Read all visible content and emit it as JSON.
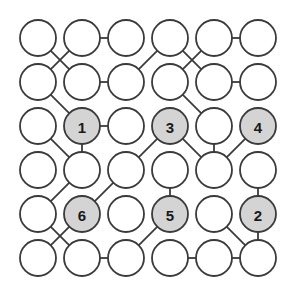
{
  "diagram": {
    "type": "node-link-graph",
    "colors": {
      "background": "#ffffff",
      "node_fill_empty": "#ffffff",
      "node_fill_labeled": "#d4d4d4",
      "node_stroke": "#3a3a3a",
      "edge_stroke": "#3a3a3a",
      "label_text": "#1a1a1a"
    },
    "geometry": {
      "width": 299,
      "height": 307,
      "columns": 6,
      "rows": 6,
      "col_x": [
        38,
        82,
        126,
        170,
        214,
        258
      ],
      "row_y": [
        38,
        82,
        126,
        170,
        214,
        258
      ],
      "node_radius": 18
    },
    "nodes": [
      {
        "id": "n0-0",
        "col": 0,
        "row": 0,
        "label": "",
        "filled": false
      },
      {
        "id": "n1-0",
        "col": 1,
        "row": 0,
        "label": "",
        "filled": false
      },
      {
        "id": "n2-0",
        "col": 2,
        "row": 0,
        "label": "",
        "filled": false
      },
      {
        "id": "n3-0",
        "col": 3,
        "row": 0,
        "label": "",
        "filled": false
      },
      {
        "id": "n4-0",
        "col": 4,
        "row": 0,
        "label": "",
        "filled": false
      },
      {
        "id": "n5-0",
        "col": 5,
        "row": 0,
        "label": "",
        "filled": false
      },
      {
        "id": "n0-1",
        "col": 0,
        "row": 1,
        "label": "",
        "filled": false
      },
      {
        "id": "n1-1",
        "col": 1,
        "row": 1,
        "label": "",
        "filled": false
      },
      {
        "id": "n2-1",
        "col": 2,
        "row": 1,
        "label": "",
        "filled": false
      },
      {
        "id": "n3-1",
        "col": 3,
        "row": 1,
        "label": "",
        "filled": false
      },
      {
        "id": "n4-1",
        "col": 4,
        "row": 1,
        "label": "",
        "filled": false
      },
      {
        "id": "n5-1",
        "col": 5,
        "row": 1,
        "label": "",
        "filled": false
      },
      {
        "id": "n0-2",
        "col": 0,
        "row": 2,
        "label": "",
        "filled": false
      },
      {
        "id": "n1-2",
        "col": 1,
        "row": 2,
        "label": "1",
        "filled": true
      },
      {
        "id": "n2-2",
        "col": 2,
        "row": 2,
        "label": "",
        "filled": false
      },
      {
        "id": "n3-2",
        "col": 3,
        "row": 2,
        "label": "3",
        "filled": true
      },
      {
        "id": "n4-2",
        "col": 4,
        "row": 2,
        "label": "",
        "filled": false
      },
      {
        "id": "n5-2",
        "col": 5,
        "row": 2,
        "label": "4",
        "filled": true
      },
      {
        "id": "n0-3",
        "col": 0,
        "row": 3,
        "label": "",
        "filled": false
      },
      {
        "id": "n1-3",
        "col": 1,
        "row": 3,
        "label": "",
        "filled": false
      },
      {
        "id": "n2-3",
        "col": 2,
        "row": 3,
        "label": "",
        "filled": false
      },
      {
        "id": "n3-3",
        "col": 3,
        "row": 3,
        "label": "",
        "filled": false
      },
      {
        "id": "n4-3",
        "col": 4,
        "row": 3,
        "label": "",
        "filled": false
      },
      {
        "id": "n5-3",
        "col": 5,
        "row": 3,
        "label": "",
        "filled": false
      },
      {
        "id": "n0-4",
        "col": 0,
        "row": 4,
        "label": "",
        "filled": false
      },
      {
        "id": "n1-4",
        "col": 1,
        "row": 4,
        "label": "6",
        "filled": true
      },
      {
        "id": "n2-4",
        "col": 2,
        "row": 4,
        "label": "",
        "filled": false
      },
      {
        "id": "n3-4",
        "col": 3,
        "row": 4,
        "label": "5",
        "filled": true
      },
      {
        "id": "n4-4",
        "col": 4,
        "row": 4,
        "label": "",
        "filled": false
      },
      {
        "id": "n5-4",
        "col": 5,
        "row": 4,
        "label": "2",
        "filled": true
      },
      {
        "id": "n0-5",
        "col": 0,
        "row": 5,
        "label": "",
        "filled": false
      },
      {
        "id": "n1-5",
        "col": 1,
        "row": 5,
        "label": "",
        "filled": false
      },
      {
        "id": "n2-5",
        "col": 2,
        "row": 5,
        "label": "",
        "filled": false
      },
      {
        "id": "n3-5",
        "col": 3,
        "row": 5,
        "label": "",
        "filled": false
      },
      {
        "id": "n4-5",
        "col": 4,
        "row": 5,
        "label": "",
        "filled": false
      },
      {
        "id": "n5-5",
        "col": 5,
        "row": 5,
        "label": "",
        "filled": false
      }
    ],
    "edges": [
      {
        "from": "n1-0",
        "to": "n2-0"
      },
      {
        "from": "n4-0",
        "to": "n5-0"
      },
      {
        "from": "n0-0",
        "to": "n1-1"
      },
      {
        "from": "n1-0",
        "to": "n0-1"
      },
      {
        "from": "n3-0",
        "to": "n2-1"
      },
      {
        "from": "n3-0",
        "to": "n4-1"
      },
      {
        "from": "n4-0",
        "to": "n3-1"
      },
      {
        "from": "n1-1",
        "to": "n2-1"
      },
      {
        "from": "n4-1",
        "to": "n5-1"
      },
      {
        "from": "n0-1",
        "to": "n1-2"
      },
      {
        "from": "n3-1",
        "to": "n4-2"
      },
      {
        "from": "n1-2",
        "to": "n2-2"
      },
      {
        "from": "n0-2",
        "to": "n1-3"
      },
      {
        "from": "n1-2",
        "to": "n1-3"
      },
      {
        "from": "n3-2",
        "to": "n2-3"
      },
      {
        "from": "n3-2",
        "to": "n4-3"
      },
      {
        "from": "n4-2",
        "to": "n4-3"
      },
      {
        "from": "n5-2",
        "to": "n4-3"
      },
      {
        "from": "n1-3",
        "to": "n0-4"
      },
      {
        "from": "n2-3",
        "to": "n1-4"
      },
      {
        "from": "n3-3",
        "to": "n3-4"
      },
      {
        "from": "n5-3",
        "to": "n5-4"
      },
      {
        "from": "n0-4",
        "to": "n1-5"
      },
      {
        "from": "n1-4",
        "to": "n0-5"
      },
      {
        "from": "n3-4",
        "to": "n2-5"
      },
      {
        "from": "n4-4",
        "to": "n5-5"
      },
      {
        "from": "n5-4",
        "to": "n5-5"
      },
      {
        "from": "n1-5",
        "to": "n2-5"
      },
      {
        "from": "n3-5",
        "to": "n4-5"
      },
      {
        "from": "n4-5",
        "to": "n5-5"
      }
    ]
  }
}
